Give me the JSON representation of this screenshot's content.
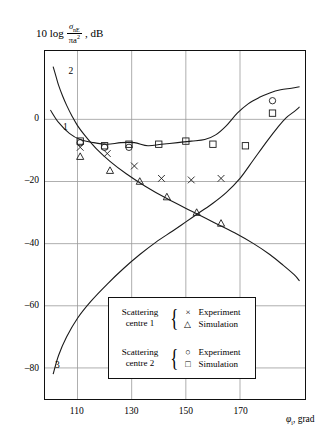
{
  "axes": {
    "ylabel_lead": "10 log",
    "ylabel_num": "σ",
    "ylabel_num_sub": "nE",
    "ylabel_den": "πa",
    "ylabel_den_sup": "2",
    "ylabel_tail": ", dB",
    "xlabel_sym": "φ",
    "xlabel_sub": "i",
    "xlabel_tail": ", grad"
  },
  "legend": {
    "groups": [
      {
        "name_line1": "Scattering",
        "name_line2": "centre 1",
        "entries": [
          {
            "marker": "cross-marker",
            "glyph": "×",
            "label": "Experiment"
          },
          {
            "marker": "triangle-marker",
            "glyph": "△",
            "label": "Simulation"
          }
        ]
      },
      {
        "name_line1": "Scattering",
        "name_line2": "centre 2",
        "entries": [
          {
            "marker": "circle-marker",
            "glyph": "○",
            "label": "Experiment"
          },
          {
            "marker": "square-marker",
            "glyph": "□",
            "label": "Simulation"
          }
        ]
      }
    ]
  },
  "chart_data": {
    "type": "line",
    "title": "",
    "xlabel": "φi, grad",
    "ylabel": "10 log(σnE/πa²), dB",
    "xlim": [
      98,
      194
    ],
    "ylim": [
      -90,
      22
    ],
    "xticks": [
      110,
      130,
      150,
      170
    ],
    "yticks": [
      0,
      -20,
      -40,
      -60,
      -80
    ],
    "grid": true,
    "legend_position": "inside-bottom-left",
    "curve_labels": [
      {
        "text": "1",
        "x": 105,
        "y": -3
      },
      {
        "text": "2",
        "x": 107,
        "y": 15
      },
      {
        "text": "3",
        "x": 102,
        "y": -79
      }
    ],
    "series": [
      {
        "name": "2",
        "kind": "line",
        "x": [
          101,
          102,
          103,
          104.5,
          106,
          108,
          110,
          113,
          117,
          122,
          128,
          135,
          143,
          152,
          160,
          168,
          175,
          181,
          186,
          190,
          192
        ],
        "values": [
          17,
          14,
          11,
          7.5,
          4.5,
          1,
          -2,
          -5.5,
          -9.5,
          -13.5,
          -17.5,
          -21.5,
          -25.5,
          -29.5,
          -33,
          -36.5,
          -40,
          -43.5,
          -47,
          -50,
          -52
        ]
      },
      {
        "name": "1",
        "kind": "line",
        "x": [
          100,
          103,
          107,
          111,
          116,
          121,
          126,
          131,
          136,
          141,
          147,
          152,
          157,
          161,
          165,
          169,
          173,
          177,
          181,
          185,
          189,
          192
        ],
        "values": [
          3,
          -1,
          -4.5,
          -6.5,
          -7.5,
          -8,
          -7.5,
          -7.5,
          -8.5,
          -8,
          -7.5,
          -7,
          -6.5,
          -5,
          -2,
          2,
          5,
          7,
          8.5,
          9.5,
          10,
          10.5
        ]
      },
      {
        "name": "3",
        "kind": "line",
        "x": [
          101,
          103,
          106,
          110,
          115,
          121,
          127,
          133,
          139,
          145,
          150,
          155,
          160,
          165,
          170,
          175,
          180,
          184,
          187,
          190,
          192
        ],
        "values": [
          -82,
          -76,
          -70,
          -64,
          -58.5,
          -53,
          -48,
          -43.5,
          -39.5,
          -36,
          -33,
          -30,
          -27,
          -23.5,
          -19,
          -13,
          -7,
          -2.5,
          0.5,
          2.5,
          4
        ]
      },
      {
        "name": "Scattering centre 2 — Simulation",
        "kind": "scatter",
        "marker": "square",
        "x": [
          111,
          120,
          129,
          140,
          150,
          160,
          172,
          182
        ],
        "values": [
          -7,
          -8.5,
          -8,
          -8,
          -7,
          -8,
          -8.5,
          2
        ]
      },
      {
        "name": "Scattering centre 2 — Experiment",
        "kind": "scatter",
        "marker": "circle",
        "x": [
          111,
          120,
          129,
          182
        ],
        "values": [
          -7.5,
          -9,
          -9,
          6
        ]
      },
      {
        "name": "Scattering centre 1 — Experiment",
        "kind": "scatter",
        "marker": "cross",
        "x": [
          111,
          121,
          131,
          141,
          152,
          163
        ],
        "values": [
          -9,
          -11,
          -15,
          -19,
          -19.5,
          -19
        ]
      },
      {
        "name": "Scattering centre 1 — Simulation",
        "kind": "scatter",
        "marker": "triangle",
        "x": [
          111,
          122,
          133,
          143,
          154,
          163
        ],
        "values": [
          -12,
          -16.5,
          -20,
          -25,
          -30,
          -33.5
        ]
      }
    ]
  }
}
